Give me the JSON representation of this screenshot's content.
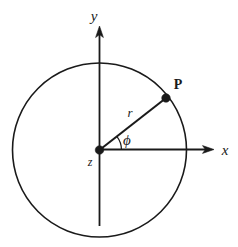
{
  "figure": {
    "type": "polar-coordinate-diagram",
    "background_color": "#ffffff",
    "stroke_color": "#1a1a1a",
    "width": 238,
    "height": 247,
    "labels": {
      "y_axis": "y",
      "x_axis": "x",
      "point": "P",
      "radius": "r",
      "angle": "ϕ",
      "origin": "z"
    },
    "geometry": {
      "origin_x": 99,
      "origin_y": 150,
      "circle_radius": 87,
      "y_axis_tip_y": 27,
      "x_axis_tip_x": 214,
      "point_x": 166,
      "point_y": 98,
      "angle_degrees": 38,
      "arc_radius": 22,
      "dot_radius": 4.2,
      "line_width": 1.6
    }
  }
}
